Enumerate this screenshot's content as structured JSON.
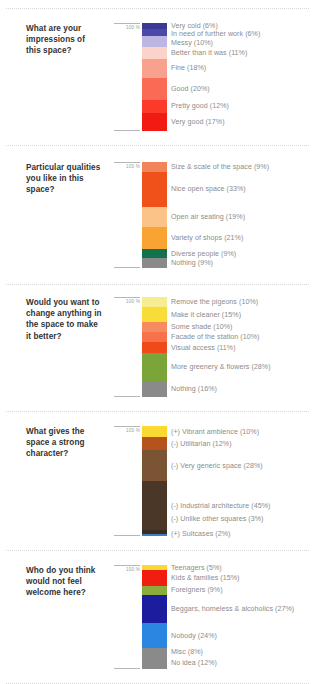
{
  "page": {
    "axis_top_label": "100 %",
    "background": "#ffffff",
    "question_color": "#333333",
    "legend_color": "#8c8c8c"
  },
  "chart_data": [
    {
      "type": "bar",
      "title": "What are your impressions of this space?",
      "orientation": "vertical-stacked",
      "ylim": [
        0,
        100
      ],
      "ylabel": "100 %",
      "categories": [
        "Very cold",
        "In need of further work",
        "Messy",
        "Better than it was",
        "Fine",
        "Good",
        "Pretty good",
        "Very good"
      ],
      "values": [
        6,
        6,
        10,
        11,
        18,
        20,
        12,
        17
      ],
      "labels": [
        "Very cold (6%)",
        "In need of further work (6%)",
        "Messy (10%)",
        "Better than it was (11%)",
        "Fine (18%)",
        "Good (20%)",
        "Pretty good (12%)",
        "Very good (17%)"
      ],
      "colors": [
        "#3a3a96",
        "#4a4aa8",
        "#bdb6e0",
        "#fbd3ca",
        "#f7a18e",
        "#fa6a55",
        "#fb3a2a",
        "#f21b12"
      ]
    },
    {
      "type": "bar",
      "title": "Particular qualities you like in this space?",
      "orientation": "vertical-stacked",
      "ylim": [
        0,
        100
      ],
      "ylabel": "100 %",
      "categories": [
        "Size & scale of the space",
        "Nice open space",
        "Open air seating",
        "Variety of shops",
        "Diverse people",
        "Nothing"
      ],
      "values": [
        9,
        33,
        19,
        21,
        9,
        9
      ],
      "labels": [
        "Size & scale of the space (9%)",
        "Nice open space (33%)",
        "Open air seating (19%)",
        "Variety of shops (21%)",
        "Diverse people (9%)",
        "Nothing (9%)"
      ],
      "colors": [
        "#f2845c",
        "#f0511b",
        "#fbc387",
        "#f9a332",
        "#12724c",
        "#8a8a8a"
      ]
    },
    {
      "type": "bar",
      "title": "Would you want to change anything in the space to make it better?",
      "orientation": "vertical-stacked",
      "ylim": [
        0,
        100
      ],
      "ylabel": "100 %",
      "categories": [
        "Remove the pigeons",
        "Make it cleaner",
        "Some shade",
        "Facade of the station",
        "Visual access",
        "More greenery & flowers",
        "Nothing"
      ],
      "values": [
        10,
        15,
        10,
        10,
        11,
        28,
        16
      ],
      "labels": [
        "Remove the pigeons (10%)",
        "Make it cleaner (15%)",
        "Some shade (10%)",
        "Facade of the station (10%)",
        "Visual access (11%)",
        "More greenery & flowers (28%)",
        "Nothing (16%)"
      ],
      "colors": [
        "#f7ec90",
        "#f7dd35",
        "#f58b5f",
        "#f7714a",
        "#f04a18",
        "#7aa639",
        "#8a8a8a"
      ]
    },
    {
      "type": "bar",
      "title": "What gives the space a strong character?",
      "orientation": "vertical-stacked",
      "ylim": [
        0,
        100
      ],
      "ylabel": "100 %",
      "categories": [
        "(+) Vibrant ambience",
        "(-) Utilitarian",
        "(-) Very generic space",
        "(-) Industrial architecture",
        "(-) Unlike other squares",
        "(+) Suitcases"
      ],
      "values": [
        10,
        12,
        28,
        45,
        3,
        2
      ],
      "labels": [
        "(+) Vibrant ambience (10%)",
        "(-) Utilitarian (12%)",
        "(-) Very generic space (28%)",
        "(-) Industrial architecture (45%)",
        "(-) Unlike other squares (3%)",
        "(+) Suitcases (2%)"
      ],
      "colors": [
        "#fbd931",
        "#b6531c",
        "#7b5434",
        "#4a3727",
        "#3a2c20",
        "#3e7ec4"
      ]
    },
    {
      "type": "bar",
      "title": "Who do you think would not feel welcome here?",
      "orientation": "vertical-stacked",
      "ylim": [
        0,
        100
      ],
      "ylabel": "100 %",
      "categories": [
        "Teenagers",
        "Kids & families",
        "Foreigners",
        "Beggars, homeless & alcoholics",
        "Nobody",
        "Misc",
        "No idea"
      ],
      "values": [
        5,
        15,
        9,
        27,
        24,
        8,
        12
      ],
      "labels": [
        "Teenagers (5%)",
        "Kids & families (15%)",
        "Foreigners (9%)",
        "Beggars, homeless & alcoholics (27%)",
        "Nobody (24%)",
        "Misc (8%)",
        "No idea (12%)"
      ],
      "colors": [
        "#fbd931",
        "#f01e10",
        "#8cab3d",
        "#1c1c9e",
        "#2a86e0",
        "#8a8a8a",
        "#8a8a8a"
      ]
    }
  ]
}
